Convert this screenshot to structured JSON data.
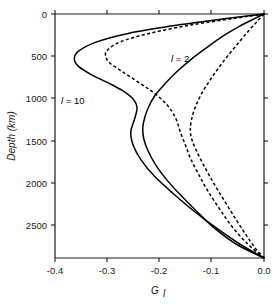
{
  "chart_data": {
    "type": "line",
    "title": "",
    "xlabel": "G_l",
    "xlabel_base": "G",
    "xlabel_sub": "l",
    "ylabel": "Depth (km)",
    "xlim": [
      -0.4,
      0.0
    ],
    "ylim": [
      0,
      2890
    ],
    "y_inverted": true,
    "grid": false,
    "legend": "inline-annotations",
    "xticks": [
      -0.4,
      -0.3,
      -0.2,
      -0.1,
      0.0
    ],
    "xticklabels": [
      "-0.4",
      "-0.3",
      "-0.2",
      "-0.1",
      "0.0"
    ],
    "yticks": [
      0,
      500,
      1000,
      1500,
      2000,
      2500
    ],
    "yticklabels": [
      "0",
      "500",
      "1000",
      "1500",
      "2000",
      "2500"
    ],
    "annotations": [
      {
        "text": "l = 10",
        "text_italic_part": "l",
        "text_rest": " = 10",
        "x": -0.375,
        "y": 1020
      },
      {
        "text": "l = 2",
        "text_italic_part": "l",
        "text_rest": " = 2",
        "x": -0.165,
        "y": 560
      }
    ],
    "series": [
      {
        "name": "l=10 solid",
        "style": "solid",
        "degree": 10,
        "points": [
          {
            "x": 0.0,
            "y": 0
          },
          {
            "x": -0.08,
            "y": 60
          },
          {
            "x": -0.175,
            "y": 140
          },
          {
            "x": -0.26,
            "y": 230
          },
          {
            "x": -0.32,
            "y": 330
          },
          {
            "x": -0.355,
            "y": 440
          },
          {
            "x": -0.363,
            "y": 530
          },
          {
            "x": -0.355,
            "y": 620
          },
          {
            "x": -0.33,
            "y": 720
          },
          {
            "x": -0.3,
            "y": 810
          },
          {
            "x": -0.27,
            "y": 910
          },
          {
            "x": -0.25,
            "y": 1010
          },
          {
            "x": -0.243,
            "y": 1110
          },
          {
            "x": -0.248,
            "y": 1250
          },
          {
            "x": -0.255,
            "y": 1400
          },
          {
            "x": -0.25,
            "y": 1560
          },
          {
            "x": -0.235,
            "y": 1730
          },
          {
            "x": -0.21,
            "y": 1920
          },
          {
            "x": -0.175,
            "y": 2120
          },
          {
            "x": -0.135,
            "y": 2330
          },
          {
            "x": -0.09,
            "y": 2540
          },
          {
            "x": -0.045,
            "y": 2730
          },
          {
            "x": 0.0,
            "y": 2890
          }
        ]
      },
      {
        "name": "l=10 dashed",
        "style": "dashed",
        "degree": 10,
        "points": [
          {
            "x": 0.0,
            "y": 0
          },
          {
            "x": -0.06,
            "y": 55
          },
          {
            "x": -0.14,
            "y": 130
          },
          {
            "x": -0.22,
            "y": 230
          },
          {
            "x": -0.275,
            "y": 330
          },
          {
            "x": -0.3,
            "y": 430
          },
          {
            "x": -0.303,
            "y": 500
          },
          {
            "x": -0.295,
            "y": 580
          },
          {
            "x": -0.272,
            "y": 680
          },
          {
            "x": -0.245,
            "y": 790
          },
          {
            "x": -0.218,
            "y": 900
          },
          {
            "x": -0.196,
            "y": 1010
          },
          {
            "x": -0.18,
            "y": 1120
          },
          {
            "x": -0.168,
            "y": 1250
          },
          {
            "x": -0.16,
            "y": 1400
          },
          {
            "x": -0.15,
            "y": 1560
          },
          {
            "x": -0.14,
            "y": 1720
          },
          {
            "x": -0.125,
            "y": 1900
          },
          {
            "x": -0.108,
            "y": 2090
          },
          {
            "x": -0.086,
            "y": 2300
          },
          {
            "x": -0.062,
            "y": 2510
          },
          {
            "x": -0.032,
            "y": 2720
          },
          {
            "x": 0.0,
            "y": 2890
          }
        ]
      },
      {
        "name": "l=2 solid",
        "style": "solid",
        "degree": 2,
        "points": [
          {
            "x": 0.0,
            "y": 0
          },
          {
            "x": -0.02,
            "y": 60
          },
          {
            "x": -0.048,
            "y": 150
          },
          {
            "x": -0.078,
            "y": 260
          },
          {
            "x": -0.11,
            "y": 400
          },
          {
            "x": -0.14,
            "y": 540
          },
          {
            "x": -0.168,
            "y": 690
          },
          {
            "x": -0.19,
            "y": 830
          },
          {
            "x": -0.208,
            "y": 960
          },
          {
            "x": -0.22,
            "y": 1090
          },
          {
            "x": -0.228,
            "y": 1220
          },
          {
            "x": -0.232,
            "y": 1350
          },
          {
            "x": -0.23,
            "y": 1480
          },
          {
            "x": -0.222,
            "y": 1620
          },
          {
            "x": -0.208,
            "y": 1780
          },
          {
            "x": -0.188,
            "y": 1950
          },
          {
            "x": -0.162,
            "y": 2130
          },
          {
            "x": -0.13,
            "y": 2330
          },
          {
            "x": -0.096,
            "y": 2530
          },
          {
            "x": -0.052,
            "y": 2730
          },
          {
            "x": 0.0,
            "y": 2890
          }
        ]
      },
      {
        "name": "l=2 dashed",
        "style": "dashed",
        "degree": 2,
        "points": [
          {
            "x": 0.0,
            "y": 0
          },
          {
            "x": -0.012,
            "y": 80
          },
          {
            "x": -0.028,
            "y": 190
          },
          {
            "x": -0.046,
            "y": 320
          },
          {
            "x": -0.066,
            "y": 470
          },
          {
            "x": -0.086,
            "y": 630
          },
          {
            "x": -0.104,
            "y": 790
          },
          {
            "x": -0.12,
            "y": 950
          },
          {
            "x": -0.132,
            "y": 1110
          },
          {
            "x": -0.139,
            "y": 1260
          },
          {
            "x": -0.141,
            "y": 1380
          },
          {
            "x": -0.138,
            "y": 1490
          },
          {
            "x": -0.13,
            "y": 1610
          },
          {
            "x": -0.118,
            "y": 1760
          },
          {
            "x": -0.104,
            "y": 1920
          },
          {
            "x": -0.088,
            "y": 2090
          },
          {
            "x": -0.07,
            "y": 2270
          },
          {
            "x": -0.052,
            "y": 2450
          },
          {
            "x": -0.034,
            "y": 2620
          },
          {
            "x": -0.016,
            "y": 2780
          },
          {
            "x": 0.0,
            "y": 2890
          }
        ]
      }
    ]
  }
}
